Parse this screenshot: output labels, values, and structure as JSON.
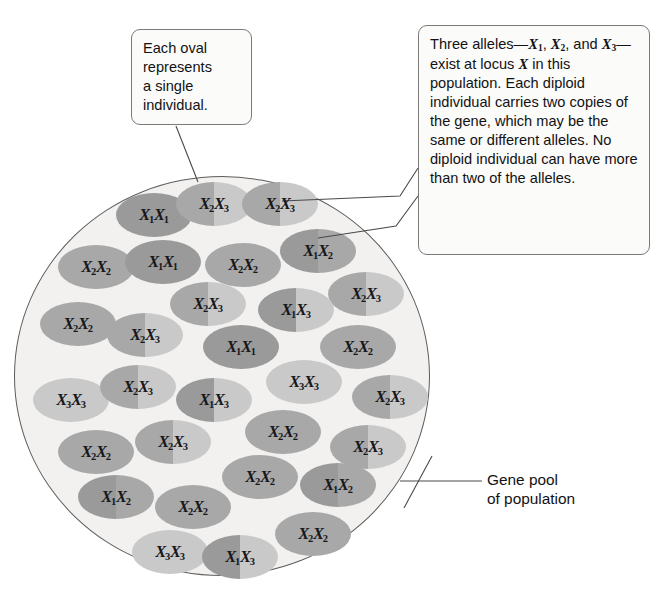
{
  "figure": {
    "type": "biology-diagram"
  },
  "colors": {
    "allele_X1": "#9a9a9a",
    "allele_X2": "#a8a8a8",
    "allele_X3": "#c9c9c9",
    "pool_fill": "#f2f1ef",
    "pool_stroke": "#5d5d5d",
    "callout_fill": "#fbfbfa",
    "callout_stroke": "#7a7a7a",
    "text": "#121214"
  },
  "callouts": {
    "left": {
      "name": "each-oval-callout",
      "lines": [
        "Each oval",
        "represents",
        "a single",
        "individual."
      ]
    },
    "right": {
      "name": "three-alleles-callout",
      "text": "Three alleles—X1, X2, and X3—exist at locus X in this population. Each diploid individual carries two copies of the gene, which may be the same or different alleles. No diploid individual can have more than two of the alleles."
    }
  },
  "labels": {
    "gene_pool": "Gene pool\nof population"
  },
  "legend": {
    "alleles": [
      "X1",
      "X2",
      "X3"
    ],
    "locus": "X"
  },
  "individuals": [
    {
      "id": 1,
      "genotype": "X1X1",
      "a1": "X1",
      "a2": "X1",
      "x": 116,
      "y": 193
    },
    {
      "id": 2,
      "genotype": "X2X3",
      "a1": "X2",
      "a2": "X3",
      "x": 176,
      "y": 182
    },
    {
      "id": 3,
      "genotype": "X2X3",
      "a1": "X2",
      "a2": "X3",
      "x": 242,
      "y": 182
    },
    {
      "id": 4,
      "genotype": "X2X2",
      "a1": "X2",
      "a2": "X2",
      "x": 58,
      "y": 245
    },
    {
      "id": 5,
      "genotype": "X1X1",
      "a1": "X1",
      "a2": "X1",
      "x": 125,
      "y": 240
    },
    {
      "id": 6,
      "genotype": "X2X2",
      "a1": "X2",
      "a2": "X2",
      "x": 205,
      "y": 243
    },
    {
      "id": 7,
      "genotype": "X1X2",
      "a1": "X1",
      "a2": "X2",
      "x": 280,
      "y": 229
    },
    {
      "id": 8,
      "genotype": "X2X3",
      "a1": "X2",
      "a2": "X3",
      "x": 328,
      "y": 272
    },
    {
      "id": 9,
      "genotype": "X2X3",
      "a1": "X2",
      "a2": "X3",
      "x": 170,
      "y": 282
    },
    {
      "id": 10,
      "genotype": "X1X3",
      "a1": "X1",
      "a2": "X3",
      "x": 258,
      "y": 288
    },
    {
      "id": 11,
      "genotype": "X2X2",
      "a1": "X2",
      "a2": "X2",
      "x": 40,
      "y": 302
    },
    {
      "id": 12,
      "genotype": "X2X3",
      "a1": "X2",
      "a2": "X3",
      "x": 107,
      "y": 313
    },
    {
      "id": 13,
      "genotype": "X1X1",
      "a1": "X1",
      "a2": "X1",
      "x": 203,
      "y": 325
    },
    {
      "id": 14,
      "genotype": "X2X2",
      "a1": "X2",
      "a2": "X2",
      "x": 320,
      "y": 325
    },
    {
      "id": 15,
      "genotype": "X3X3",
      "a1": "X3",
      "a2": "X3",
      "x": 266,
      "y": 360
    },
    {
      "id": 16,
      "genotype": "X3X3",
      "a1": "X3",
      "a2": "X3",
      "x": 33,
      "y": 378
    },
    {
      "id": 17,
      "genotype": "X2X3",
      "a1": "X2",
      "a2": "X3",
      "x": 100,
      "y": 365
    },
    {
      "id": 18,
      "genotype": "X1X3",
      "a1": "X1",
      "a2": "X3",
      "x": 176,
      "y": 378
    },
    {
      "id": 19,
      "genotype": "X2X3",
      "a1": "X2",
      "a2": "X3",
      "x": 352,
      "y": 375
    },
    {
      "id": 20,
      "genotype": "X2X2",
      "a1": "X2",
      "a2": "X2",
      "x": 245,
      "y": 410
    },
    {
      "id": 21,
      "genotype": "X2X3",
      "a1": "X2",
      "a2": "X3",
      "x": 330,
      "y": 425
    },
    {
      "id": 22,
      "genotype": "X2X2",
      "a1": "X2",
      "a2": "X2",
      "x": 58,
      "y": 430
    },
    {
      "id": 23,
      "genotype": "X2X3",
      "a1": "X2",
      "a2": "X3",
      "x": 135,
      "y": 420
    },
    {
      "id": 24,
      "genotype": "X2X2",
      "a1": "X2",
      "a2": "X2",
      "x": 222,
      "y": 455
    },
    {
      "id": 25,
      "genotype": "X1X2",
      "a1": "X1",
      "a2": "X2",
      "x": 300,
      "y": 463
    },
    {
      "id": 26,
      "genotype": "X1X2",
      "a1": "X1",
      "a2": "X2",
      "x": 78,
      "y": 475
    },
    {
      "id": 27,
      "genotype": "X2X2",
      "a1": "X2",
      "a2": "X2",
      "x": 155,
      "y": 485
    },
    {
      "id": 28,
      "genotype": "X2X2",
      "a1": "X2",
      "a2": "X2",
      "x": 275,
      "y": 512
    },
    {
      "id": 29,
      "genotype": "X3X3",
      "a1": "X3",
      "a2": "X3",
      "x": 132,
      "y": 530
    },
    {
      "id": 30,
      "genotype": "X1X3",
      "a1": "X1",
      "a2": "X3",
      "x": 202,
      "y": 535
    }
  ]
}
